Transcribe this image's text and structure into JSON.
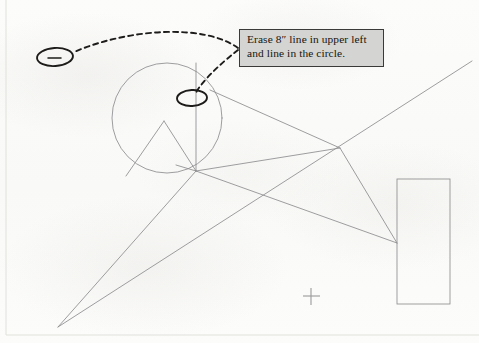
{
  "document": {
    "type": "scanned-markup-drawing",
    "background_color": "#fbfbfa",
    "width": 479,
    "height": 343
  },
  "annotation": {
    "callout": {
      "name": "erase-instruction-callout",
      "line1": "Erase 8″ line in upper left",
      "line2": "and line in the circle.",
      "fill_color": "#d4d4d2",
      "border_color": "#3a3a38",
      "x": 239,
      "y": 29,
      "width": 145,
      "height": 38
    },
    "marks": [
      {
        "name": "ellipse-upper-left",
        "shape": "ellipse",
        "cx": 55,
        "cy": 57,
        "rx": 18,
        "ry": 9,
        "rotation": -4,
        "color": "#1d1c1a",
        "encircles": "8-inch-line-segment"
      },
      {
        "name": "ellipse-in-circle",
        "shape": "ellipse",
        "cx": 192,
        "cy": 98,
        "rx": 15,
        "ry": 8,
        "rotation": -3,
        "color": "#1d1c1a",
        "encircles": "vertical-line-in-circle"
      }
    ],
    "leaders": [
      {
        "name": "leader-to-upper-left-ellipse",
        "style": "dashed",
        "color": "#1d1c1a",
        "from": [
          238,
          48
        ],
        "to": [
          74,
          52
        ]
      },
      {
        "name": "leader-to-circle-ellipse",
        "style": "dashed",
        "color": "#1d1c1a",
        "from": [
          238,
          50
        ],
        "to": [
          196,
          92
        ]
      }
    ],
    "short_tick": {
      "name": "eight-inch-line-segment",
      "x1": 47,
      "y1": 58,
      "x2": 61,
      "y2": 58,
      "color": "#1d1c1a"
    }
  },
  "cad_drawing": {
    "line_color": "#8d8d8f",
    "border_color": "#dcdcd8",
    "circle": {
      "name": "main-circle",
      "cx": 167,
      "cy": 118,
      "r": 55
    },
    "rectangle": {
      "name": "right-rectangle",
      "x": 397,
      "y": 179,
      "width": 53,
      "height": 125
    },
    "crosshair": {
      "name": "center-crosshair-marker",
      "cx": 311,
      "cy": 296,
      "size": 17
    },
    "vertices": {
      "hub": [
        196,
        171
      ],
      "apex_lower_left": [
        58,
        327
      ],
      "peak_in_circle": [
        164,
        121
      ],
      "crossing_right": [
        340,
        148
      ],
      "rect_left_node": [
        397,
        243
      ]
    },
    "segments": [
      {
        "name": "vertical-line-through-circle",
        "x1": 196,
        "y1": 63,
        "x2": 196,
        "y2": 171
      },
      {
        "name": "circle-peak-left-leg",
        "x1": 164,
        "y1": 121,
        "x2": 126,
        "y2": 176
      },
      {
        "name": "circle-peak-right-leg",
        "x1": 164,
        "y1": 121,
        "x2": 196,
        "y2": 171
      },
      {
        "name": "hub-to-lower-left-apex",
        "x1": 196,
        "y1": 171,
        "x2": 58,
        "y2": 327
      },
      {
        "name": "long-diagonal-lower-left-to-upper-right",
        "x1": 58,
        "y1": 327,
        "x2": 472,
        "y2": 61
      },
      {
        "name": "hub-to-crossing-right",
        "x1": 196,
        "y1": 171,
        "x2": 340,
        "y2": 148
      },
      {
        "name": "hub-to-rect-node",
        "x1": 196,
        "y1": 171,
        "x2": 397,
        "y2": 243
      },
      {
        "name": "crossing-right-to-rect-node",
        "x1": 340,
        "y1": 148,
        "x2": 397,
        "y2": 243
      },
      {
        "name": "circle-right-tangent-to-crossing",
        "x1": 210,
        "y1": 90,
        "x2": 340,
        "y2": 148
      },
      {
        "name": "hub-short-left-stub",
        "x1": 196,
        "y1": 171,
        "x2": 176,
        "y2": 165
      }
    ]
  }
}
